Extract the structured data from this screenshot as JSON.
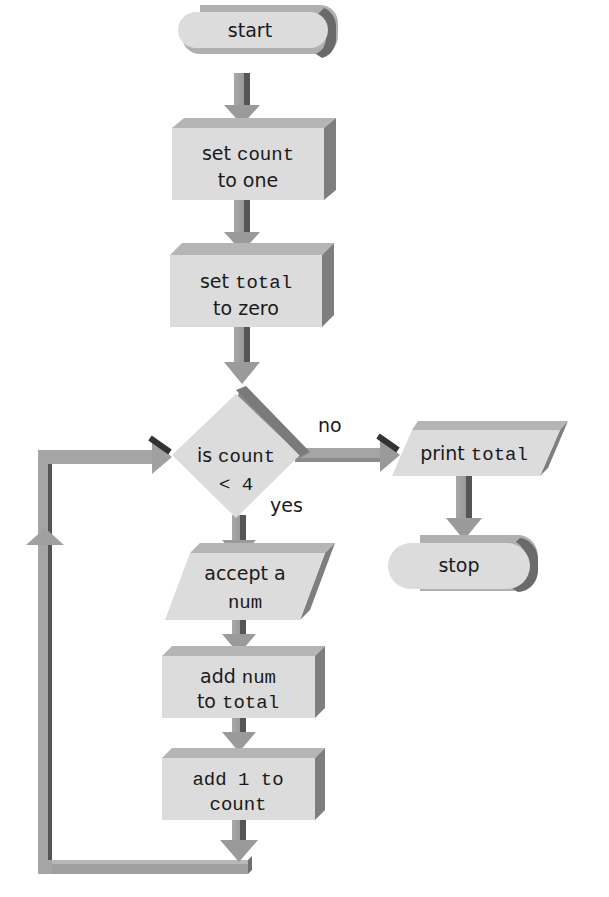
{
  "diagram": {
    "type": "flowchart",
    "colors": {
      "face": "#dcdcdc",
      "top": "#b5b5b5",
      "side": "#8a8a8a",
      "arrow": "#9a9a9a",
      "arrow_dark": "#555555",
      "text": "#1a1a1a"
    },
    "nodes": {
      "start": {
        "shape": "terminal",
        "text": "start"
      },
      "set_count": {
        "shape": "process",
        "line1_a": "set ",
        "line1_b": "count",
        "line2": "to one"
      },
      "set_total": {
        "shape": "process",
        "line1_a": "set ",
        "line1_b": "total",
        "line2": "to zero"
      },
      "decision": {
        "shape": "decision",
        "line1_a": "is ",
        "line1_b": "count",
        "line2": "<  4"
      },
      "print_total": {
        "shape": "io",
        "text_a": "print ",
        "text_b": "total"
      },
      "stop": {
        "shape": "terminal",
        "text": "stop"
      },
      "accept": {
        "shape": "io",
        "line1": "accept a",
        "line2": "num"
      },
      "add_num": {
        "shape": "process",
        "line1_a": "add ",
        "line1_b": "num",
        "line2_a": "to ",
        "line2_b": "total"
      },
      "add_one": {
        "shape": "process",
        "line1": "add 1 to",
        "line2": "count"
      }
    },
    "edge_labels": {
      "no": "no",
      "yes": "yes"
    },
    "edges": [
      {
        "from": "start",
        "to": "set_count"
      },
      {
        "from": "set_count",
        "to": "set_total"
      },
      {
        "from": "set_total",
        "to": "decision"
      },
      {
        "from": "decision",
        "to": "print_total",
        "label": "no"
      },
      {
        "from": "print_total",
        "to": "stop"
      },
      {
        "from": "decision",
        "to": "accept",
        "label": "yes"
      },
      {
        "from": "accept",
        "to": "add_num"
      },
      {
        "from": "add_num",
        "to": "add_one"
      },
      {
        "from": "add_one",
        "to": "decision",
        "note": "loop back"
      }
    ]
  }
}
